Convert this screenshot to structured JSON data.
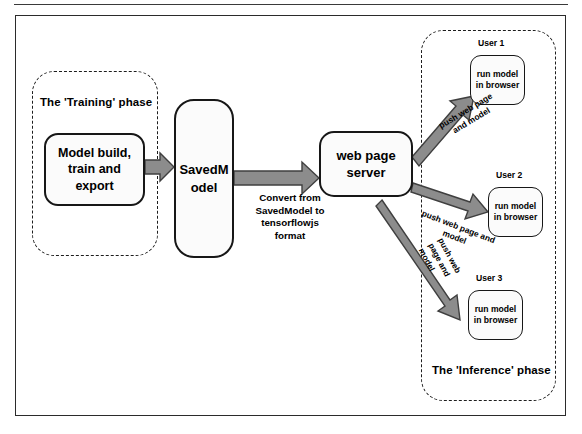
{
  "figure": {
    "accent_arrow_color": "#808080",
    "arrow_outline_color": "#3f3f3f",
    "node_border_color": "#171717",
    "dashed_group_color": "#1d1d1d"
  },
  "groups": {
    "training": {
      "label": "The 'Training' phase"
    },
    "inference": {
      "label": "The 'Inference' phase"
    }
  },
  "nodes": {
    "model_build": {
      "label": "Model build,\ntrain and\nexport"
    },
    "saved_model": {
      "label": "SavedM\nodel"
    },
    "web_server": {
      "label": "web page\nserver"
    },
    "user_1": {
      "caption": "User 1",
      "label": "run model\nin browser"
    },
    "user_2": {
      "caption": "User 2",
      "label": "run model\nin browser"
    },
    "user_3": {
      "caption": "User 3",
      "label": "run model\nin browser"
    }
  },
  "edges": {
    "train_to_savedmodel": {
      "label": ""
    },
    "savedmodel_to_server": {
      "label": "Convert from\nSavedModel to\ntensorflowjs\nformat"
    },
    "server_to_user1": {
      "label": "push web page\nand model"
    },
    "server_to_user2": {
      "label": "push web page and\nmodel"
    },
    "server_to_user3": {
      "label": "push web\npage and\nmodel"
    }
  }
}
